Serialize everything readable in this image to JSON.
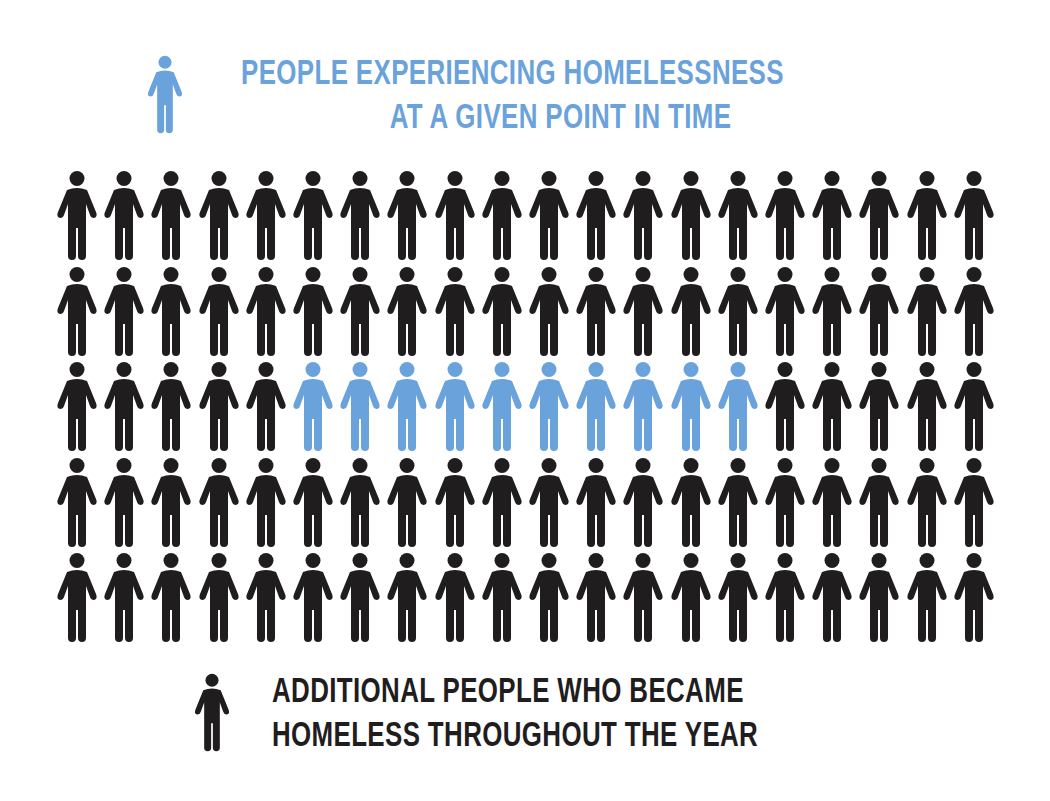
{
  "colors": {
    "point_in_time": "#6aa2dc",
    "additional": "#1f1d1e",
    "background": "#ffffff"
  },
  "legend": {
    "top": {
      "icon": "person-icon-blue",
      "line1": "PEOPLE EXPERIENCING HOMELESSNESS",
      "line2": "AT A GIVEN POINT IN TIME"
    },
    "bottom": {
      "icon": "person-icon-black",
      "line1": "ADDITIONAL PEOPLE WHO BECAME",
      "line2": "HOMELESS THROUGHOUT THE YEAR"
    }
  },
  "chart_data": {
    "type": "pictogram",
    "title": "",
    "rows": 5,
    "columns": 20,
    "total_icons": 100,
    "series": [
      {
        "name": "People experiencing homelessness at a given point in time",
        "count": 10,
        "color": "#6aa2dc"
      },
      {
        "name": "Additional people who became homeless throughout the year",
        "count": 90,
        "color": "#1f1d1e"
      }
    ],
    "highlight": {
      "row": 3,
      "start_column": 6,
      "end_column": 15
    },
    "grid": [
      [
        "k",
        "k",
        "k",
        "k",
        "k",
        "k",
        "k",
        "k",
        "k",
        "k",
        "k",
        "k",
        "k",
        "k",
        "k",
        "k",
        "k",
        "k",
        "k",
        "k"
      ],
      [
        "k",
        "k",
        "k",
        "k",
        "k",
        "k",
        "k",
        "k",
        "k",
        "k",
        "k",
        "k",
        "k",
        "k",
        "k",
        "k",
        "k",
        "k",
        "k",
        "k"
      ],
      [
        "k",
        "k",
        "k",
        "k",
        "k",
        "b",
        "b",
        "b",
        "b",
        "b",
        "b",
        "b",
        "b",
        "b",
        "b",
        "k",
        "k",
        "k",
        "k",
        "k"
      ],
      [
        "k",
        "k",
        "k",
        "k",
        "k",
        "k",
        "k",
        "k",
        "k",
        "k",
        "k",
        "k",
        "k",
        "k",
        "k",
        "k",
        "k",
        "k",
        "k",
        "k"
      ],
      [
        "k",
        "k",
        "k",
        "k",
        "k",
        "k",
        "k",
        "k",
        "k",
        "k",
        "k",
        "k",
        "k",
        "k",
        "k",
        "k",
        "k",
        "k",
        "k",
        "k"
      ]
    ],
    "legend_position": "top and bottom"
  }
}
